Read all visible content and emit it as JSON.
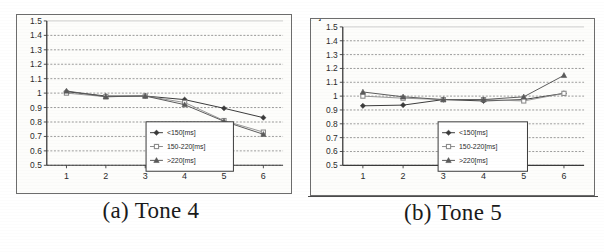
{
  "figure": {
    "panels": [
      {
        "id": "panel-a",
        "caption": "(a) Tone 4",
        "chart_data": {
          "type": "line",
          "title": "",
          "xlabel": "",
          "ylabel": "F0 Normalized",
          "x": [
            1,
            2,
            3,
            4,
            5,
            6
          ],
          "xticklabels": [
            "1",
            "2",
            "3",
            "4",
            "5",
            "6"
          ],
          "yticklabels": [
            "0.5",
            "0.6",
            "0.7",
            "0.8",
            "0.9",
            "1",
            "1.1",
            "1.2",
            "1.3",
            "1.4",
            "1.5"
          ],
          "ylim": [
            0.5,
            1.5
          ],
          "xlim": [
            0.5,
            6.5
          ],
          "grid": "horizontal-dashed",
          "legend_position": "inside-lower-right",
          "series": [
            {
              "name": "<150[ms]",
              "marker": "diamond",
              "values": [
                1.01,
                0.98,
                0.98,
                0.955,
                0.895,
                0.83
              ]
            },
            {
              "name": "150-220[ms]",
              "marker": "square",
              "values": [
                1.0,
                0.975,
                0.98,
                0.935,
                0.81,
                0.73
              ]
            },
            {
              "name": ">220[ms]",
              "marker": "triangle",
              "values": [
                1.015,
                0.975,
                0.98,
                0.92,
                0.805,
                0.715
              ]
            }
          ]
        }
      },
      {
        "id": "panel-b",
        "caption": "(b) Tone 5",
        "chart_data": {
          "type": "line",
          "title": "",
          "xlabel": "",
          "ylabel": "F0[Hz]",
          "x": [
            1,
            2,
            3,
            4,
            5,
            6
          ],
          "xticklabels": [
            "1",
            "2",
            "3",
            "4",
            "5",
            "6"
          ],
          "yticklabels": [
            "0.5",
            "0.6",
            "0.7",
            "0.8",
            "0.9",
            "1",
            "1.1",
            "1.2",
            "1.3",
            "1.4",
            "1.5"
          ],
          "ylim": [
            0.5,
            1.5
          ],
          "xlim": [
            0.5,
            6.5
          ],
          "grid": "horizontal-dashed",
          "legend_position": "inside-lower-center",
          "series": [
            {
              "name": "<150[ms]",
              "marker": "diamond",
              "values": [
                0.93,
                0.935,
                0.975,
                0.965,
                0.975,
                1.02
              ]
            },
            {
              "name": "150-220[ms]",
              "marker": "square",
              "values": [
                1.0,
                0.985,
                0.975,
                0.975,
                0.965,
                1.02
              ]
            },
            {
              "name": ">220[ms]",
              "marker": "triangle",
              "values": [
                1.03,
                0.995,
                0.975,
                0.975,
                0.995,
                1.15
              ]
            }
          ]
        }
      }
    ]
  }
}
